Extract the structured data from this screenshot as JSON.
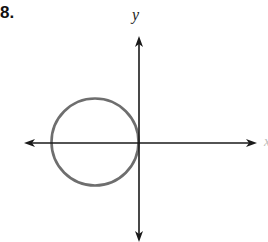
{
  "problem": {
    "number": "8."
  },
  "axes": {
    "x_label": "x",
    "y_label": "y",
    "color": "#1a1a1a"
  },
  "circle": {
    "description": "Circle in left half-plane, tangent to the y-axis at the origin, centered on the negative x-axis",
    "color": "#6e6e6e"
  }
}
